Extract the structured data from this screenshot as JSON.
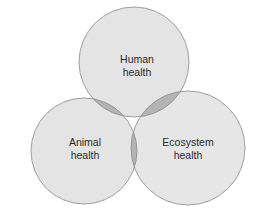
{
  "diagram": {
    "type": "venn",
    "circles": [
      {
        "id": "human",
        "label_line1": "Human",
        "label_line2": "health",
        "cx": 134,
        "cy": 62,
        "r": 55
      },
      {
        "id": "animal",
        "label_line1": "Animal",
        "label_line2": "health",
        "cx": 84,
        "cy": 151,
        "r": 53
      },
      {
        "id": "ecosystem",
        "label_line1": "Ecosystem",
        "label_line2": "health",
        "cx": 188,
        "cy": 148,
        "r": 57
      }
    ],
    "colors": {
      "fill": "#e2e2e2",
      "overlap": "#a8a8a8",
      "stroke": "#8a8a8a",
      "text": "#2a2a2a"
    }
  }
}
